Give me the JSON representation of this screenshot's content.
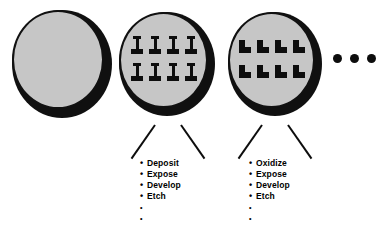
{
  "figure": {
    "background_color": "#ffffff",
    "ink_color": "#0d0d0d",
    "wafer_fill_color": "#c6c6c6",
    "wafer_edge_color": "#101010"
  },
  "wafers": [
    {
      "id": "wafer-blank",
      "label": "blank wafer",
      "pattern": "none",
      "shape_name": "",
      "shape_count": 0
    },
    {
      "id": "wafer-ibeam",
      "label": "patterned wafer",
      "pattern": "grid",
      "shape_name": "i-beam",
      "shape_count": 8,
      "columns": 4,
      "rows": 2
    },
    {
      "id": "wafer-lstep",
      "label": "patterned wafer",
      "pattern": "grid",
      "shape_name": "l-step",
      "shape_count": 8,
      "columns": 4,
      "rows": 2
    }
  ],
  "ellipsis": {
    "name": "continuation-ellipsis",
    "dots": 3
  },
  "process_lists": [
    {
      "id": "process-list-1",
      "steps": [
        "Deposit",
        "Expose",
        "Develop",
        "Etch",
        "",
        ""
      ]
    },
    {
      "id": "process-list-2",
      "steps": [
        "Oxidize",
        "Expose",
        "Develop",
        "Etch",
        "",
        ""
      ]
    }
  ],
  "bullet_glyph": "•",
  "leaders": [
    {
      "id": "leader-1-left"
    },
    {
      "id": "leader-1-right"
    },
    {
      "id": "leader-2-left"
    },
    {
      "id": "leader-2-right"
    }
  ]
}
